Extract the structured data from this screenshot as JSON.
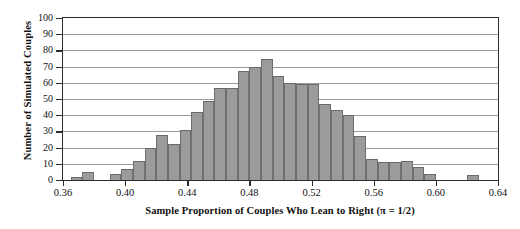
{
  "chart_data": {
    "type": "bar",
    "title": "",
    "subtitle": "",
    "xlabel": "Sample Proportion of Couples Who Lean to Right (π = 1/2)",
    "ylabel": "Number of Simulated Couples",
    "xlim": [
      0.36,
      0.64
    ],
    "ylim": [
      0,
      100
    ],
    "grid": "horizontal",
    "legend": "none",
    "bin_width": 0.005,
    "bar_fill_color": "#9b9b9b",
    "bar_edge_color": "#6a6a6a",
    "axis_color": "#2b2b2b",
    "gridline_color": "#9a9a9a",
    "xticks": [
      {
        "value": 0.36,
        "label": "0.36"
      },
      {
        "value": 0.4,
        "label": "0.40"
      },
      {
        "value": 0.44,
        "label": "0.44"
      },
      {
        "value": 0.48,
        "label": "0.48"
      },
      {
        "value": 0.52,
        "label": "0.52"
      },
      {
        "value": 0.56,
        "label": "0.56"
      },
      {
        "value": 0.6,
        "label": "0.60"
      },
      {
        "value": 0.64,
        "label": "0.64"
      }
    ],
    "yticks": [
      {
        "value": 0,
        "label": "0"
      },
      {
        "value": 10,
        "label": "10"
      },
      {
        "value": 20,
        "label": "20"
      },
      {
        "value": 30,
        "label": "30"
      },
      {
        "value": 40,
        "label": "40"
      },
      {
        "value": 50,
        "label": "50"
      },
      {
        "value": 60,
        "label": "60"
      },
      {
        "value": 70,
        "label": "70"
      },
      {
        "value": 80,
        "label": "80"
      },
      {
        "value": 90,
        "label": "90"
      },
      {
        "value": 100,
        "label": "100"
      }
    ],
    "bins": [
      {
        "x0": 0.36,
        "x1": 0.365,
        "count": 0
      },
      {
        "x0": 0.365,
        "x1": 0.37,
        "count": 2
      },
      {
        "x0": 0.37,
        "x1": 0.375,
        "count": 5
      },
      {
        "x0": 0.375,
        "x1": 0.38,
        "count": 5
      },
      {
        "x0": 0.38,
        "x1": 0.385,
        "count": 0
      },
      {
        "x0": 0.385,
        "x1": 0.39,
        "count": 0
      },
      {
        "x0": 0.39,
        "x1": 0.395,
        "count": 4
      },
      {
        "x0": 0.395,
        "x1": 0.4,
        "count": 7
      },
      {
        "x0": 0.4,
        "x1": 0.405,
        "count": 12
      },
      {
        "x0": 0.405,
        "x1": 0.41,
        "count": 12
      },
      {
        "x0": 0.41,
        "x1": 0.415,
        "count": 20
      },
      {
        "x0": 0.415,
        "x1": 0.42,
        "count": 28
      },
      {
        "x0": 0.42,
        "x1": 0.425,
        "count": 22
      },
      {
        "x0": 0.425,
        "x1": 0.43,
        "count": 31
      },
      {
        "x0": 0.43,
        "x1": 0.435,
        "count": 42
      },
      {
        "x0": 0.435,
        "x1": 0.44,
        "count": 49
      },
      {
        "x0": 0.44,
        "x1": 0.445,
        "count": 57
      },
      {
        "x0": 0.445,
        "x1": 0.45,
        "count": 57
      },
      {
        "x0": 0.45,
        "x1": 0.455,
        "count": 67
      },
      {
        "x0": 0.455,
        "x1": 0.46,
        "count": 70
      },
      {
        "x0": 0.46,
        "x1": 0.465,
        "count": 58
      },
      {
        "x0": 0.465,
        "x1": 0.47,
        "count": 63
      },
      {
        "x0": 0.47,
        "x1": 0.475,
        "count": 70
      },
      {
        "x0": 0.475,
        "x1": 0.48,
        "count": 75
      },
      {
        "x0": 0.48,
        "x1": 0.485,
        "count": 66
      },
      {
        "x0": 0.485,
        "x1": 0.49,
        "count": 60
      },
      {
        "x0": 0.49,
        "x1": 0.495,
        "count": 60
      },
      {
        "x0": 0.495,
        "x1": 0.5,
        "count": 47
      },
      {
        "x0": 0.5,
        "x1": 0.505,
        "count": 43
      },
      {
        "x0": 0.505,
        "x1": 0.51,
        "count": 40
      },
      {
        "x0": 0.51,
        "x1": 0.515,
        "count": 27
      },
      {
        "x0": 0.515,
        "x1": 0.52,
        "count": 22
      },
      {
        "x0": 0.52,
        "x1": 0.525,
        "count": 14
      },
      {
        "x0": 0.525,
        "x1": 0.53,
        "count": 13
      },
      {
        "x0": 0.53,
        "x1": 0.535,
        "count": 13
      },
      {
        "x0": 0.535,
        "x1": 0.54,
        "count": 11
      },
      {
        "x0": 0.54,
        "x1": 0.545,
        "count": 7
      },
      {
        "x0": 0.545,
        "x1": 0.55,
        "count": 4
      },
      {
        "x0": 0.55,
        "x1": 0.555,
        "count": 0
      },
      {
        "x0": 0.555,
        "x1": 0.56,
        "count": 3
      },
      {
        "x0": 0.56,
        "x1": 0.565,
        "count": 3
      },
      {
        "x0": 0.565,
        "x1": 0.57,
        "count": 0
      },
      {
        "x0": 0.57,
        "x1": 0.575,
        "count": 0
      },
      {
        "x0": 0.575,
        "x1": 0.58,
        "count": 2
      },
      {
        "x0": 0.58,
        "x1": 0.585,
        "count": 0
      },
      {
        "x0": 0.585,
        "x1": 0.59,
        "count": 0
      },
      {
        "x0": 0.59,
        "x1": 0.595,
        "count": 0
      },
      {
        "x0": 0.595,
        "x1": 0.6,
        "count": 0
      },
      {
        "x0": 0.6,
        "x1": 0.605,
        "count": 0
      },
      {
        "x0": 0.605,
        "x1": 0.61,
        "count": 0
      },
      {
        "x0": 0.61,
        "x1": 0.615,
        "count": 0
      },
      {
        "x0": 0.615,
        "x1": 0.62,
        "count": 0
      },
      {
        "x0": 0.62,
        "x1": 0.625,
        "count": 0
      },
      {
        "x0": 0.625,
        "x1": 0.63,
        "count": 0
      },
      {
        "x0": 0.63,
        "x1": 0.635,
        "count": 2
      },
      {
        "x0": 0.635,
        "x1": 0.64,
        "count": 2
      }
    ],
    "bars": [
      {
        "x0": 0.365,
        "x1": 0.3725,
        "count": 2
      },
      {
        "x0": 0.3725,
        "x1": 0.38,
        "count": 5
      },
      {
        "x0": 0.39,
        "x1": 0.3975,
        "count": 4
      },
      {
        "x0": 0.3975,
        "x1": 0.405,
        "count": 7
      },
      {
        "x0": 0.405,
        "x1": 0.4125,
        "count": 12
      },
      {
        "x0": 0.4125,
        "x1": 0.42,
        "count": 20
      },
      {
        "x0": 0.42,
        "x1": 0.4275,
        "count": 28
      },
      {
        "x0": 0.4275,
        "x1": 0.435,
        "count": 22
      },
      {
        "x0": 0.435,
        "x1": 0.4425,
        "count": 31
      },
      {
        "x0": 0.4425,
        "x1": 0.45,
        "count": 42
      },
      {
        "x0": 0.45,
        "x1": 0.4575,
        "count": 49
      },
      {
        "x0": 0.4575,
        "x1": 0.465,
        "count": 57
      },
      {
        "x0": 0.465,
        "x1": 0.4725,
        "count": 57
      },
      {
        "x0": 0.4725,
        "x1": 0.48,
        "count": 67
      },
      {
        "x0": 0.48,
        "x1": 0.4875,
        "count": 70
      },
      {
        "x0": 0.4875,
        "x1": 0.495,
        "count": 75
      },
      {
        "x0": 0.495,
        "x1": 0.5025,
        "count": 64
      },
      {
        "x0": 0.5025,
        "x1": 0.51,
        "count": 60
      },
      {
        "x0": 0.51,
        "x1": 0.5175,
        "count": 59
      },
      {
        "x0": 0.5175,
        "x1": 0.525,
        "count": 59
      },
      {
        "x0": 0.525,
        "x1": 0.5325,
        "count": 47
      },
      {
        "x0": 0.5325,
        "x1": 0.54,
        "count": 43
      },
      {
        "x0": 0.54,
        "x1": 0.5475,
        "count": 40
      },
      {
        "x0": 0.5475,
        "x1": 0.555,
        "count": 27
      },
      {
        "x0": 0.555,
        "x1": 0.5625,
        "count": 13
      },
      {
        "x0": 0.5625,
        "x1": 0.57,
        "count": 11
      },
      {
        "x0": 0.57,
        "x1": 0.5775,
        "count": 11
      },
      {
        "x0": 0.5775,
        "x1": 0.585,
        "count": 12
      },
      {
        "x0": 0.585,
        "x1": 0.5925,
        "count": 8
      },
      {
        "x0": 0.5925,
        "x1": 0.6,
        "count": 4
      },
      {
        "x0": 0.62,
        "x1": 0.6275,
        "count": 3
      }
    ]
  }
}
